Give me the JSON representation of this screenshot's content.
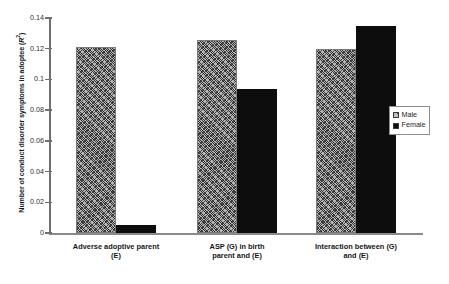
{
  "chart_data": {
    "type": "bar",
    "title": "",
    "xlabel": "",
    "ylabel": "Number of conduct disorder symptoms in adoptee (R²)",
    "ylim": [
      0,
      0.14
    ],
    "grid": false,
    "legend_position": "right",
    "categories": [
      "Adverse adoptive parent (E)",
      "ASP (G) in birth parent and (E)",
      "Interaction between (G) and (E)"
    ],
    "category_lines": [
      [
        "Adverse adoptive parent",
        "(E)"
      ],
      [
        "ASP (G) in birth",
        "parent and (E)"
      ],
      [
        "Interaction between (G)",
        "and (E)"
      ]
    ],
    "series": [
      {
        "name": "Male",
        "color": "#b4b4b4",
        "pattern": "diagonal-hatch",
        "values": [
          0.121,
          0.1255,
          0.1195
        ]
      },
      {
        "name": "Female",
        "color": "#0d0d0d",
        "pattern": "solid",
        "values": [
          0.005,
          0.094,
          0.1345
        ]
      }
    ],
    "ytick_labels": [
      "0",
      "0.02",
      "0.04",
      "0.06",
      "0.08",
      "0.1",
      "0.12",
      "0.14"
    ],
    "ytick_values": [
      0,
      0.02,
      0.04,
      0.06,
      0.08,
      0.1,
      0.12,
      0.14
    ]
  },
  "legend": {
    "items": [
      {
        "label": "Male"
      },
      {
        "label": "Female"
      }
    ]
  },
  "axis": {
    "y_title_main": "Number of conduct disorder symptoms in adoptee (",
    "y_title_sym": "R",
    "y_title_sup": "2",
    "y_title_end": ")"
  }
}
